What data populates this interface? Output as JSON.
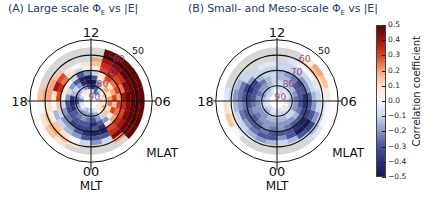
{
  "chart_data": [
    {
      "type": "heatmap",
      "projection": "polar",
      "panel": "A",
      "title": "(A)  Large scale  ΦE vs |E|",
      "center": [
        91,
        101
      ],
      "angular_axis": {
        "label": "MLT",
        "ticks": [
          "12",
          "06",
          "00",
          "18"
        ],
        "orientation": "12 top, 06 right, 00 bottom, 18 left"
      },
      "radial_axis": {
        "label": "MLAT",
        "ticks": [
          90,
          80,
          70,
          60,
          50
        ],
        "tick_color": "#8b3a6e"
      },
      "mlt_bins": 24,
      "mlat_bin_edges": [
        85,
        82,
        79,
        76,
        73,
        70,
        67,
        64,
        61,
        58,
        55
      ],
      "values_by_mlt": [
        [
          -0.1,
          -0.2,
          -0.3,
          -0.4,
          -0.3,
          -0.45,
          -0.3,
          -0.2,
          null,
          null
        ],
        [
          -0.05,
          -0.15,
          -0.2,
          -0.3,
          -0.4,
          -0.45,
          -0.3,
          -0.1,
          null,
          null
        ],
        [
          0.05,
          0.0,
          -0.1,
          -0.2,
          0.1,
          0.3,
          0.35,
          0.45,
          0.2,
          null
        ],
        [
          0.1,
          0.1,
          0.15,
          0.05,
          0.2,
          0.35,
          0.4,
          0.5,
          0.45,
          0.5
        ],
        [
          0.05,
          0.2,
          0.1,
          0.3,
          0.25,
          0.3,
          0.45,
          0.5,
          0.5,
          0.5
        ],
        [
          0.1,
          0.05,
          0.25,
          0.15,
          0.3,
          0.35,
          0.45,
          0.5,
          0.5,
          0.5
        ],
        [
          0.15,
          0.1,
          0.2,
          0.3,
          0.2,
          0.4,
          0.5,
          0.5,
          0.5,
          0.5
        ],
        [
          0.0,
          0.15,
          0.1,
          0.2,
          0.3,
          0.25,
          0.45,
          0.5,
          0.5,
          0.5
        ],
        [
          -0.1,
          0.05,
          0.2,
          0.1,
          0.25,
          0.3,
          0.35,
          0.5,
          0.5,
          0.5
        ],
        [
          -0.2,
          -0.1,
          0.1,
          0.2,
          0.3,
          0.35,
          0.4,
          0.45,
          0.5,
          0.5
        ],
        [
          -0.3,
          -0.3,
          -0.2,
          0.05,
          0.1,
          0.3,
          0.35,
          0.4,
          0.5,
          0.5
        ],
        [
          -0.1,
          -0.4,
          -0.5,
          -0.3,
          -0.1,
          0.05,
          0.15,
          0.2,
          null,
          null
        ],
        [
          0.0,
          -0.3,
          -0.5,
          -0.5,
          -0.2,
          0.0,
          0.1,
          null,
          null,
          null
        ],
        [
          0.05,
          -0.2,
          -0.4,
          -0.45,
          -0.3,
          -0.1,
          0.0,
          null,
          null,
          null
        ],
        [
          0.1,
          -0.1,
          -0.2,
          -0.3,
          -0.1,
          0.1,
          0.05,
          null,
          null,
          null
        ],
        [
          0.0,
          -0.15,
          -0.1,
          -0.2,
          0.0,
          0.25,
          0.3,
          0.15,
          null,
          null
        ],
        [
          -0.1,
          -0.2,
          -0.15,
          -0.1,
          0.1,
          0.35,
          0.4,
          0.2,
          0.15,
          null
        ],
        [
          -0.2,
          -0.3,
          -0.4,
          -0.2,
          0.05,
          0.3,
          0.1,
          0.2,
          0.2,
          0.15
        ],
        [
          -0.1,
          -0.3,
          -0.45,
          -0.3,
          -0.1,
          0.15,
          0.0,
          0.1,
          0.05,
          0.0
        ],
        [
          -0.05,
          -0.2,
          -0.4,
          -0.35,
          -0.2,
          -0.1,
          -0.15,
          0.05,
          0.15,
          0.1
        ],
        [
          0.0,
          -0.15,
          -0.3,
          -0.3,
          -0.25,
          -0.2,
          -0.1,
          0.15,
          0.2,
          0.15
        ],
        [
          -0.1,
          -0.2,
          -0.25,
          -0.3,
          -0.35,
          -0.2,
          -0.15,
          0.1,
          0.15,
          0.1
        ],
        [
          -0.15,
          -0.2,
          -0.2,
          -0.3,
          -0.35,
          -0.3,
          -0.2,
          0.0,
          0.1,
          null
        ],
        [
          -0.1,
          -0.2,
          -0.25,
          -0.3,
          -0.35,
          -0.4,
          -0.3,
          -0.1,
          null,
          null
        ]
      ],
      "annotations": [
        "12",
        "06",
        "00",
        "18",
        "MLT",
        "MLAT",
        "90",
        "80",
        "70",
        "60",
        "50"
      ]
    },
    {
      "type": "heatmap",
      "projection": "polar",
      "panel": "B",
      "title": "(B)  Small- and Meso-scale  ΦE vs |E|",
      "center": [
        277,
        101
      ],
      "angular_axis": {
        "label": "MLT",
        "ticks": [
          "12",
          "06",
          "00",
          "18"
        ],
        "orientation": "12 top, 06 right, 00 bottom, 18 left"
      },
      "radial_axis": {
        "label": "MLAT",
        "ticks": [
          90,
          80,
          70,
          60,
          50
        ],
        "tick_color": "#8b3a6e"
      },
      "mlt_bins": 24,
      "mlat_bin_edges": [
        85,
        82,
        79,
        76,
        73,
        70,
        67,
        64,
        61,
        58,
        55
      ],
      "values_by_mlt": [
        [
          -0.1,
          -0.1,
          -0.15,
          -0.2,
          -0.2,
          -0.3,
          -0.2,
          -0.1,
          null,
          null
        ],
        [
          -0.05,
          -0.1,
          -0.15,
          -0.2,
          -0.25,
          -0.3,
          -0.3,
          -0.15,
          null,
          null
        ],
        [
          0.05,
          -0.1,
          -0.1,
          -0.2,
          -0.3,
          -0.4,
          -0.5,
          -0.3,
          -0.1,
          null
        ],
        [
          0.1,
          -0.05,
          -0.1,
          -0.15,
          -0.3,
          -0.45,
          -0.5,
          -0.35,
          -0.15,
          -0.05
        ],
        [
          0.0,
          -0.1,
          -0.2,
          -0.25,
          -0.35,
          -0.35,
          -0.3,
          -0.2,
          -0.1,
          0.0
        ],
        [
          -0.05,
          -0.1,
          -0.2,
          -0.3,
          -0.4,
          -0.3,
          -0.2,
          -0.1,
          -0.05,
          0.0
        ],
        [
          -0.1,
          -0.15,
          -0.25,
          -0.3,
          -0.4,
          -0.3,
          -0.15,
          -0.1,
          0.0,
          0.05
        ],
        [
          -0.05,
          -0.1,
          -0.2,
          -0.3,
          -0.3,
          -0.2,
          -0.1,
          -0.05,
          0.1,
          0.15
        ],
        [
          0.0,
          -0.1,
          -0.15,
          -0.3,
          -0.35,
          -0.2,
          -0.1,
          0.0,
          0.15,
          0.2
        ],
        [
          -0.05,
          -0.05,
          -0.15,
          -0.2,
          -0.25,
          -0.15,
          -0.1,
          0.0,
          0.1,
          0.05
        ],
        [
          -0.1,
          -0.1,
          -0.1,
          -0.15,
          -0.2,
          -0.1,
          -0.1,
          -0.05,
          null,
          null
        ],
        [
          -0.05,
          -0.1,
          -0.1,
          -0.15,
          -0.15,
          -0.1,
          -0.1,
          null,
          null,
          null
        ],
        [
          0.0,
          -0.05,
          -0.1,
          -0.1,
          -0.1,
          -0.1,
          -0.05,
          null,
          null,
          null
        ],
        [
          -0.05,
          -0.1,
          -0.15,
          -0.15,
          -0.1,
          -0.1,
          -0.05,
          null,
          null,
          null
        ],
        [
          -0.1,
          -0.15,
          -0.2,
          -0.25,
          -0.15,
          -0.1,
          -0.1,
          null,
          null,
          null
        ],
        [
          -0.1,
          -0.15,
          -0.2,
          -0.3,
          -0.35,
          -0.2,
          -0.1,
          -0.1,
          null,
          null
        ],
        [
          -0.1,
          -0.2,
          -0.25,
          -0.3,
          -0.4,
          -0.35,
          -0.25,
          -0.15,
          -0.1,
          null
        ],
        [
          -0.1,
          -0.15,
          -0.2,
          -0.3,
          -0.35,
          -0.3,
          -0.25,
          -0.2,
          -0.1,
          -0.05
        ],
        [
          -0.05,
          -0.1,
          -0.2,
          -0.25,
          -0.3,
          -0.25,
          -0.2,
          -0.15,
          0.0,
          0.1
        ],
        [
          -0.05,
          -0.1,
          -0.2,
          -0.2,
          -0.25,
          -0.3,
          -0.25,
          -0.1,
          0.1,
          0.15
        ],
        [
          -0.1,
          -0.15,
          -0.2,
          -0.25,
          -0.3,
          -0.3,
          -0.2,
          -0.1,
          -0.05,
          0.0
        ],
        [
          -0.1,
          -0.15,
          -0.2,
          -0.2,
          -0.25,
          -0.3,
          -0.25,
          -0.15,
          -0.05,
          null
        ],
        [
          -0.05,
          -0.1,
          -0.15,
          -0.2,
          -0.2,
          -0.25,
          -0.3,
          -0.2,
          null,
          null
        ],
        [
          -0.05,
          -0.1,
          -0.15,
          -0.2,
          -0.25,
          -0.3,
          -0.3,
          -0.15,
          null,
          null
        ]
      ],
      "annotations": [
        "12",
        "06",
        "00",
        "18",
        "MLT",
        "MLAT",
        "90",
        "80",
        "70",
        "60",
        "50"
      ]
    }
  ],
  "colorbar": {
    "label": "Correlation coefficient",
    "ticks": [
      "0.5",
      "0.4",
      "0.3",
      "0.2",
      "0.1",
      "0.0",
      "−0.1",
      "−0.2",
      "−0.3",
      "−0.4",
      "−0.5"
    ],
    "range": [
      -0.5,
      0.5
    ],
    "colormap": [
      "#1b1a4e",
      "#2a2f78",
      "#4a5596",
      "#8a97c4",
      "#c9d6ee",
      "#f4f6fb",
      "#fde3c8",
      "#f5a57a",
      "#e0431f",
      "#a51410",
      "#5e0508"
    ],
    "no_data_color": "#d6d6d6"
  },
  "panels": {
    "a": {
      "title_prefix": "(A)  Large scale  Φ",
      "title_sub": "E",
      "title_suffix": " vs |E|"
    },
    "b": {
      "title_prefix": "(B)  Small- and Meso-scale  Φ",
      "title_sub": "E",
      "title_suffix": " vs |E|"
    }
  },
  "labels": {
    "mlt_top": "12",
    "mlt_right": "06",
    "mlt_bottom": "00",
    "mlt_left": "18",
    "mlt_axis": "MLT",
    "mlat_axis": "MLAT",
    "lat_rings": [
      "90",
      "80",
      "70",
      "60",
      "50"
    ]
  }
}
